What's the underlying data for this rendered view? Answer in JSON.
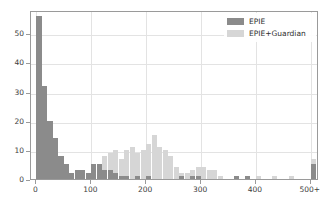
{
  "chart_data": {
    "type": "bar",
    "title": "",
    "subtitle": "",
    "xlabel": "",
    "ylabel": "",
    "xlim": [
      -10,
      515
    ],
    "ylim": [
      0,
      58
    ],
    "grid": true,
    "legend_position": "upper right",
    "bin_width": 10,
    "x_ticks": [
      0,
      100,
      200,
      300,
      400,
      500
    ],
    "x_tick_labels": [
      "0",
      "100",
      "200",
      "300",
      "400",
      "500+"
    ],
    "y_ticks": [
      0,
      10,
      20,
      30,
      40,
      50
    ],
    "y_tick_labels": [
      "0",
      "10",
      "20",
      "30",
      "40",
      "50"
    ],
    "bin_centers": [
      5,
      15,
      25,
      35,
      45,
      55,
      65,
      75,
      85,
      95,
      105,
      115,
      125,
      135,
      145,
      155,
      165,
      175,
      185,
      195,
      205,
      215,
      225,
      235,
      245,
      255,
      265,
      275,
      285,
      295,
      305,
      315,
      325,
      335,
      345,
      355,
      365,
      375,
      385,
      395,
      405,
      415,
      425,
      435,
      445,
      455,
      465,
      475,
      485,
      505
    ],
    "series": [
      {
        "name": "EPIE",
        "color": "#8b8b8b",
        "values": [
          56,
          32,
          20,
          14,
          8,
          5,
          2,
          3,
          3,
          2,
          5,
          5,
          3,
          3,
          2,
          1,
          1,
          0,
          1,
          0,
          1,
          0,
          0,
          0,
          0,
          0,
          1,
          0,
          1,
          1,
          0,
          0,
          0,
          0,
          0,
          0,
          1,
          0,
          1,
          0,
          0,
          0,
          0,
          0,
          0,
          0,
          0,
          0,
          0,
          5
        ]
      },
      {
        "name": "EPIE+Guardian",
        "color": "#d6d6d6",
        "values": [
          2,
          2,
          1,
          1,
          1,
          1,
          1,
          2,
          2,
          2,
          3,
          3,
          8,
          9,
          10,
          7,
          10,
          11,
          9,
          10,
          12,
          15,
          11,
          10,
          8,
          4,
          2,
          2,
          3,
          4,
          4,
          3,
          3,
          1,
          0,
          0,
          1,
          0,
          1,
          0,
          1,
          0,
          0,
          1,
          0,
          0,
          1,
          0,
          0,
          7
        ]
      }
    ]
  },
  "legend": {
    "entries": [
      {
        "label": "EPIE",
        "color": "#8b8b8b"
      },
      {
        "label": "EPIE+Guardian",
        "color": "#d6d6d6"
      }
    ]
  }
}
